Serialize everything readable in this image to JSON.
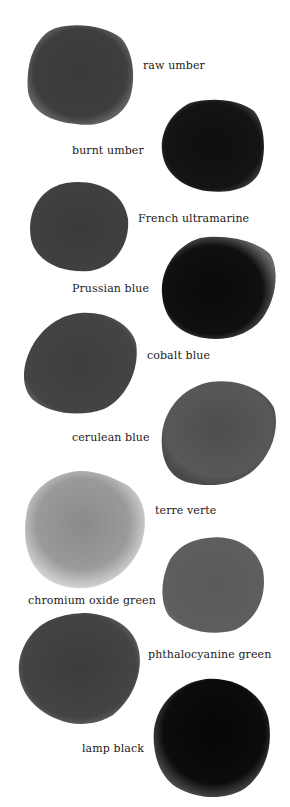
{
  "swatches": [
    {
      "name": "raw umber",
      "tone": "#3a3a3a",
      "edge": "#555555",
      "label_x": 143,
      "label_y": 60,
      "blob": {
        "x": 26,
        "y": 22,
        "w": 110,
        "h": 106
      }
    },
    {
      "name": "burnt umber",
      "tone": "#0f0f0f",
      "edge": "#2a2a2a",
      "label_x": 72,
      "label_y": 145,
      "blob": {
        "x": 160,
        "y": 97,
        "w": 107,
        "h": 97
      }
    },
    {
      "name": "French ultramarine",
      "tone": "#3c3c3c",
      "edge": "#4a4a4a",
      "label_x": 138,
      "label_y": 213,
      "blob": {
        "x": 28,
        "y": 181,
        "w": 101,
        "h": 91
      }
    },
    {
      "name": "Prussian blue",
      "tone": "#0c0c0c",
      "edge": "#3a3a3a",
      "label_x": 72,
      "label_y": 283,
      "blob": {
        "x": 160,
        "y": 236,
        "w": 118,
        "h": 105
      }
    },
    {
      "name": "cobalt blue",
      "tone": "#404040",
      "edge": "#4e4e4e",
      "label_x": 147,
      "label_y": 350,
      "blob": {
        "x": 20,
        "y": 311,
        "w": 118,
        "h": 105
      }
    },
    {
      "name": "cerulean blue",
      "tone": "#555555",
      "edge": "#4a4a4a",
      "label_x": 72,
      "label_y": 432,
      "blob": {
        "x": 160,
        "y": 380,
        "w": 118,
        "h": 108
      }
    },
    {
      "name": "terre verte",
      "tone": "#888888",
      "edge": "#c8c8c8",
      "label_x": 155,
      "label_y": 505,
      "blob": {
        "x": 23,
        "y": 469,
        "w": 125,
        "h": 122
      }
    },
    {
      "name": "chromium oxide green",
      "tone": "#5c5c5c",
      "edge": "#606060",
      "label_x": 28,
      "label_y": 595,
      "blob": {
        "x": 159,
        "y": 536,
        "w": 107,
        "h": 98
      }
    },
    {
      "name": "phthalocyanine green",
      "tone": "#3e3e3e",
      "edge": "#505050",
      "label_x": 148,
      "label_y": 649,
      "blob": {
        "x": 17,
        "y": 611,
        "w": 124,
        "h": 115
      }
    },
    {
      "name": "lamp black",
      "tone": "#080808",
      "edge": "#3a3a3a",
      "label_x": 82,
      "label_y": 743,
      "blob": {
        "x": 152,
        "y": 677,
        "w": 120,
        "h": 122
      }
    }
  ]
}
